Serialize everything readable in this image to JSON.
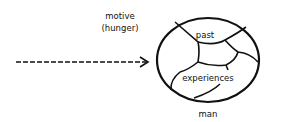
{
  "diagram": {
    "motive_label_line1": "motive",
    "motive_label_line2": "(hunger)",
    "arrow_style": "dashed",
    "circle_label_top": "past",
    "circle_label_bottom": "experiences",
    "caption": "man",
    "stroke_color": "#111111",
    "background": "#ffffff"
  }
}
